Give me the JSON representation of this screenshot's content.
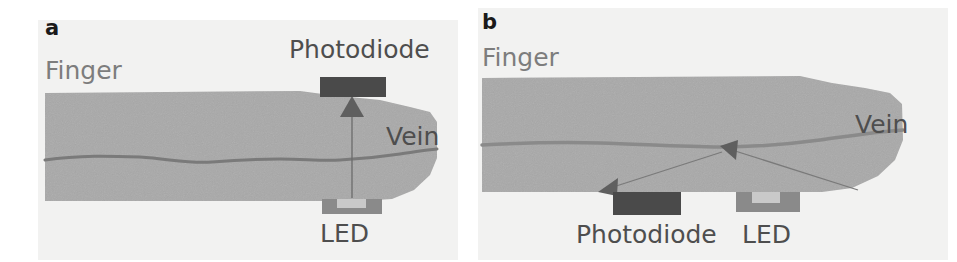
{
  "figure": {
    "width": 957,
    "height": 262,
    "background_color": "#ffffff",
    "panel_background_color": "#f2f2f1",
    "type": "scientific-figure"
  },
  "colors": {
    "finger_fill": "#a9a9a9",
    "vein_stroke": "#7a7a7a",
    "photodiode_fill": "#4a4a4a",
    "led_fill": "#8a8a8a",
    "led_notch": "#c9c9c9",
    "arrow_stroke": "#6b6b6b",
    "panel_letter": "#1a1a1a",
    "label_gray": "#7d7d7d",
    "label_dark": "#4e4e4e"
  },
  "panels": [
    {
      "id": "a",
      "letter": "a",
      "mode": "transmission",
      "labels": {
        "finger": "Finger",
        "vein": "Vein",
        "photodiode": "Photodiode",
        "led": "LED"
      },
      "components": [
        {
          "name": "photodiode",
          "label": "Photodiode",
          "position": "above-finger",
          "shape": "solid-rectangle"
        },
        {
          "name": "led",
          "label": "LED",
          "position": "below-finger",
          "shape": "notched-rectangle"
        },
        {
          "name": "finger",
          "label": "Finger",
          "shape": "tapered-bar"
        },
        {
          "name": "vein",
          "label": "Vein",
          "shape": "wavy-line"
        },
        {
          "name": "light-path",
          "shape": "straight-arrow",
          "direction": "led-to-photodiode"
        }
      ]
    },
    {
      "id": "b",
      "letter": "b",
      "mode": "reflection",
      "labels": {
        "finger": "Finger",
        "vein": "Vein",
        "photodiode": "Photodiode",
        "led": "LED"
      },
      "components": [
        {
          "name": "photodiode",
          "label": "Photodiode",
          "position": "below-finger-left",
          "shape": "solid-rectangle"
        },
        {
          "name": "led",
          "label": "LED",
          "position": "below-finger-right",
          "shape": "notched-rectangle"
        },
        {
          "name": "finger",
          "label": "Finger",
          "shape": "tapered-bar"
        },
        {
          "name": "vein",
          "label": "Vein",
          "shape": "wavy-line"
        },
        {
          "name": "light-path",
          "shape": "v-shaped-arrow",
          "direction": "led-to-vein-to-photodiode"
        }
      ]
    }
  ]
}
